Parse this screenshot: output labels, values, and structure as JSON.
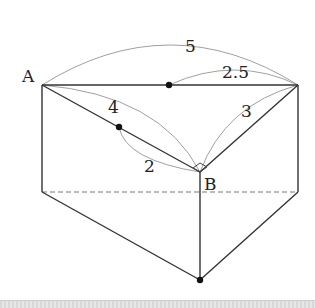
{
  "diagram": {
    "type": "triangular prism with dimension arcs",
    "points": {
      "A": {
        "label": "A",
        "x": 42,
        "y": 85
      },
      "C": {
        "x": 298,
        "y": 85
      },
      "B": {
        "label": "B",
        "x": 200,
        "y": 172
      },
      "A_bottom": {
        "x": 42,
        "y": 192
      },
      "C_bottom": {
        "x": 298,
        "y": 192
      },
      "B_bottom": {
        "x": 200,
        "y": 280
      },
      "M_AC": {
        "x": 169,
        "y": 85
      },
      "P_AB": {
        "x": 119,
        "y": 127
      }
    },
    "labels": {
      "A": "A",
      "B": "B",
      "len_AC": "5",
      "len_MC": "2.5",
      "len_AB": "4",
      "len_PB": "2",
      "len_BC": "3"
    },
    "right_angle_at": "B",
    "colors": {
      "edge": "#333333",
      "arc": "#999999",
      "dashed": "#777777",
      "point": "#111111"
    }
  }
}
